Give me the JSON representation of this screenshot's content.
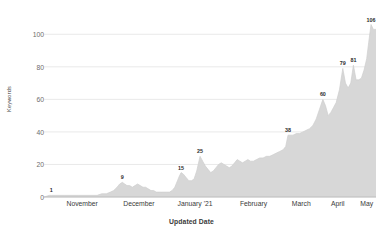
{
  "chart_data": {
    "type": "area",
    "title": "",
    "xlabel": "Updated Date",
    "ylabel": "Keywords",
    "ylim": [
      0,
      110
    ],
    "yticks": [
      0,
      20,
      40,
      60,
      80,
      100
    ],
    "grid": true,
    "legend": "none",
    "fill_color": "#d7d7d7",
    "line_color": "#cfcfcf",
    "grid_color": "#e3e3e3",
    "axis_color": "#b5b5b5",
    "xticks": [
      {
        "label": "November",
        "pos": 0.115
      },
      {
        "label": "December",
        "pos": 0.286
      },
      {
        "label": "January '21",
        "pos": 0.455
      },
      {
        "label": "February",
        "pos": 0.631
      },
      {
        "label": "March",
        "pos": 0.775
      },
      {
        "label": "April",
        "pos": 0.885
      },
      {
        "label": "May",
        "pos": 0.972
      }
    ],
    "annotations": [
      {
        "label": "1",
        "x": 0.022,
        "y": 1
      },
      {
        "label": "9",
        "x": 0.236,
        "y": 9
      },
      {
        "label": "15",
        "x": 0.413,
        "y": 15
      },
      {
        "label": "25",
        "x": 0.47,
        "y": 25
      },
      {
        "label": "38",
        "x": 0.735,
        "y": 38
      },
      {
        "label": "60",
        "x": 0.84,
        "y": 60
      },
      {
        "label": "79",
        "x": 0.9,
        "y": 79
      },
      {
        "label": "81",
        "x": 0.932,
        "y": 81
      },
      {
        "label": "106",
        "x": 0.985,
        "y": 106
      }
    ],
    "x": [
      0.0,
      0.016,
      0.022,
      0.034,
      0.048,
      0.062,
      0.076,
      0.09,
      0.104,
      0.118,
      0.132,
      0.146,
      0.16,
      0.174,
      0.188,
      0.2,
      0.21,
      0.22,
      0.228,
      0.236,
      0.243,
      0.25,
      0.258,
      0.266,
      0.274,
      0.282,
      0.29,
      0.298,
      0.306,
      0.314,
      0.322,
      0.33,
      0.338,
      0.346,
      0.354,
      0.362,
      0.37,
      0.378,
      0.386,
      0.394,
      0.402,
      0.408,
      0.413,
      0.42,
      0.428,
      0.436,
      0.444,
      0.452,
      0.46,
      0.47,
      0.478,
      0.486,
      0.494,
      0.502,
      0.51,
      0.518,
      0.526,
      0.534,
      0.542,
      0.55,
      0.558,
      0.566,
      0.574,
      0.582,
      0.59,
      0.598,
      0.606,
      0.614,
      0.622,
      0.631,
      0.64,
      0.65,
      0.66,
      0.67,
      0.68,
      0.69,
      0.7,
      0.71,
      0.72,
      0.728,
      0.735,
      0.742,
      0.75,
      0.76,
      0.77,
      0.78,
      0.79,
      0.8,
      0.81,
      0.82,
      0.83,
      0.84,
      0.848,
      0.856,
      0.864,
      0.872,
      0.88,
      0.89,
      0.9,
      0.908,
      0.916,
      0.924,
      0.932,
      0.94,
      0.948,
      0.956,
      0.964,
      0.972,
      0.978,
      0.985,
      0.992,
      1.0
    ],
    "y": [
      0,
      1,
      1,
      1,
      1,
      1,
      1,
      1,
      1,
      1,
      1,
      1,
      1,
      2,
      2,
      3,
      4,
      6,
      8,
      9,
      8,
      7,
      7,
      6,
      7,
      8,
      7,
      6,
      6,
      5,
      4,
      4,
      3,
      3,
      3,
      3,
      3,
      3,
      4,
      6,
      10,
      13,
      15,
      14,
      12,
      10,
      10,
      11,
      16,
      25,
      22,
      19,
      17,
      15,
      16,
      18,
      20,
      21,
      20,
      19,
      18,
      19,
      21,
      23,
      22,
      21,
      22,
      23,
      22,
      22,
      23,
      24,
      24,
      25,
      25,
      26,
      27,
      28,
      29,
      31,
      38,
      38,
      38,
      39,
      39,
      40,
      41,
      42,
      44,
      48,
      54,
      60,
      56,
      50,
      52,
      55,
      58,
      66,
      79,
      70,
      67,
      70,
      81,
      72,
      72,
      73,
      78,
      85,
      95,
      106,
      103,
      103
    ]
  }
}
